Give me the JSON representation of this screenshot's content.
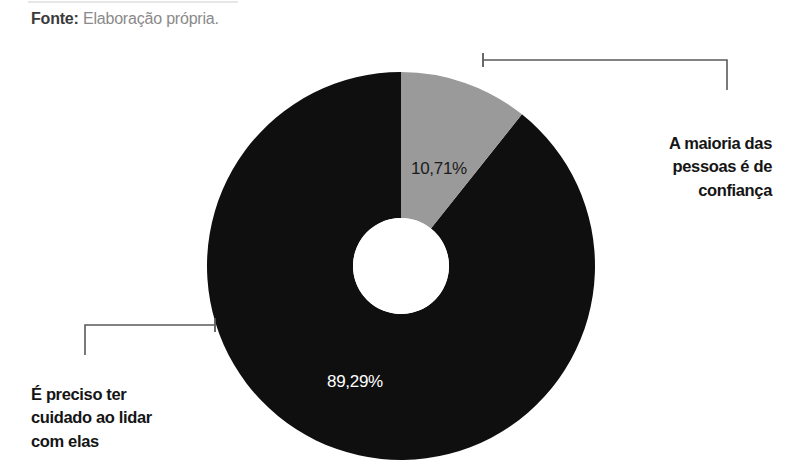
{
  "source": {
    "label": "Fonte:",
    "value": "Elaboração própria."
  },
  "chart_data": {
    "type": "pie",
    "variant": "donut",
    "title": "",
    "subtitle": "",
    "xlabel": "",
    "ylabel": "",
    "legend_position": "callouts",
    "grid": false,
    "start_angle_deg": 0,
    "direction": "clockwise",
    "categories": [
      "A maioria das pessoas é de confiança",
      "É preciso ter cuidado ao lidar com elas"
    ],
    "values": [
      10.71,
      89.29
    ],
    "value_labels": [
      "10,71%",
      "89,29%"
    ],
    "colors": [
      "#9a9a9a",
      "#0f0f0f"
    ],
    "slices": [
      {
        "name": "A maioria das pessoas é de confiança",
        "value": 10.71,
        "value_label": "10,71%",
        "color": "#9a9a9a",
        "label_color": "#1c1c1c"
      },
      {
        "name": "É preciso ter cuidado ao lidar com elas",
        "value": 89.29,
        "value_label": "89,29%",
        "color": "#0f0f0f",
        "label_color": "#ffffff"
      }
    ]
  },
  "callouts": {
    "right": {
      "name": "A maioria das pessoas é de confiança",
      "lines": [
        "A maioria das",
        "pessoas é de",
        "confiança"
      ]
    },
    "left": {
      "name": "É preciso ter cuidado ao lidar com elas",
      "lines": [
        "É preciso ter",
        "cuidado ao lidar",
        "com elas"
      ]
    }
  },
  "colors": {
    "slice_light": "#9a9a9a",
    "slice_dark": "#0f0f0f",
    "leader_line": "#5a5a5a",
    "text_dark": "#151515",
    "text_muted": "#8a8a8a",
    "background": "#ffffff"
  }
}
